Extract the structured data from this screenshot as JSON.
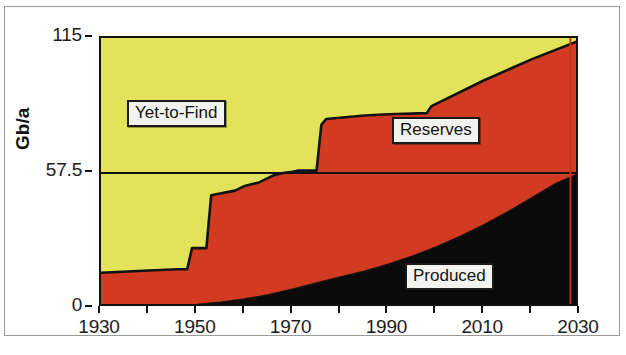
{
  "figure": {
    "axis_title": "Gb/a",
    "background_color": "#ffffff",
    "frame_color": "#121212"
  },
  "colors": {
    "yet_to_find": "#e2e35a",
    "reserves": "#d33a22",
    "produced": "#0a0a0a",
    "outline": "#121212",
    "marker_line": "#c4331d",
    "label_box_fill": "#f2f2ee"
  },
  "labels": {
    "yet_to_find": "Yet-to-Find",
    "reserves": "Reserves",
    "produced": "Produced"
  },
  "chart_data": {
    "type": "area",
    "title": "",
    "xlabel": "",
    "ylabel": "Gb/a",
    "xlim": [
      1930,
      2030
    ],
    "ylim": [
      0,
      115
    ],
    "xticks": [
      1930,
      1940,
      1950,
      1960,
      1970,
      1980,
      1990,
      2000,
      2010,
      2020,
      2030
    ],
    "xtick_labels": [
      "1930",
      "",
      "1950",
      "",
      "1970",
      "",
      "1990",
      "",
      "2010",
      "",
      "2030"
    ],
    "yticks": [
      0,
      57.5,
      115
    ],
    "ytick_labels": [
      "0",
      "57.5",
      "115"
    ],
    "grid": false,
    "legend": "inline-annotations",
    "stacking": "cumulative-to-total",
    "annotations": [
      {
        "text": "Yet-to-Find",
        "x": 1947,
        "y": 92
      },
      {
        "text": "Reserves",
        "x": 1995,
        "y": 72
      },
      {
        "text": "Produced",
        "x": 2007,
        "y": 16
      }
    ],
    "marker_lines": [
      {
        "x": 2028,
        "color": "#c4331d",
        "orientation": "vertical"
      }
    ],
    "series": [
      {
        "name": "Produced",
        "color": "#0a0a0a",
        "description": "Cumulative produced oil, lower black band",
        "x": [
          1930,
          1940,
          1950,
          1955,
          1960,
          1965,
          1970,
          1975,
          1980,
          1985,
          1990,
          1995,
          2000,
          2005,
          2010,
          2015,
          2020,
          2025,
          2030
        ],
        "values": [
          0.4,
          0.8,
          1.5,
          2.4,
          3.8,
          5.6,
          8.0,
          10.6,
          13.2,
          15.6,
          18.6,
          22.0,
          26.0,
          30.5,
          35.5,
          41.0,
          47.0,
          53.0,
          57.5
        ]
      },
      {
        "name": "Reserves",
        "color": "#d33a22",
        "description": "Cumulative Produced + Reserves, red band upper boundary",
        "x": [
          1930,
          1940,
          1946,
          1948,
          1949,
          1952,
          1953,
          1958,
          1960,
          1963,
          1966,
          1968,
          1970,
          1971,
          1975,
          1976,
          1977,
          1985,
          1990,
          1998,
          1999,
          2010,
          2020,
          2030
        ],
        "values": [
          15.0,
          16.0,
          16.5,
          16.5,
          25.5,
          25.5,
          48.0,
          50.0,
          52.0,
          53.5,
          56.5,
          57.5,
          58.0,
          58.5,
          58.5,
          78.0,
          80.5,
          82.0,
          82.5,
          83.0,
          86.0,
          97.0,
          106.0,
          114.0
        ]
      },
      {
        "name": "Yet-to-Find",
        "color": "#e2e35a",
        "description": "Remainder up to the constant total of 115 Gb/a",
        "x": [
          1930,
          2030
        ],
        "values": [
          115,
          115
        ]
      }
    ]
  }
}
